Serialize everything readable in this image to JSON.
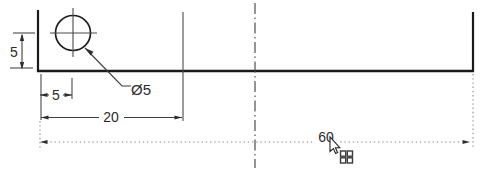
{
  "drawing": {
    "type": "technical-sketch-with-dimensions",
    "labels": {
      "dim_hole_offset_bottom": "5",
      "dim_hole_offset_left": "5",
      "dim_intermediate": "20",
      "dim_overall_length": "60",
      "dim_hole_diameter": "Ø5"
    },
    "values": {
      "hole_offset_bottom": 5,
      "hole_offset_left": 5,
      "intermediate_length": 20,
      "overall_length": 60,
      "hole_diameter": 5
    },
    "colors": {
      "outline": "#1a1a1a",
      "dimension_line": "#3c3c3c",
      "extension_line": "#4a4a4a",
      "preview_dotted": "#8a8a8a",
      "text": "#2b2b2b",
      "background": "#ffffff"
    }
  },
  "cursor": {
    "style": "arrow-pointer-with-grid-snap-badge"
  }
}
